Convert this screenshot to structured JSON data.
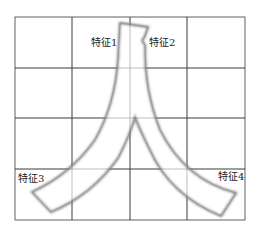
{
  "diagram": {
    "character": "人",
    "grid": {
      "cols": 4,
      "rows": 4,
      "line_color": "#3a3a3a",
      "stroke_outline_color": "#8a8a8a"
    },
    "labels": [
      {
        "id": "feature-1",
        "text": "特征1"
      },
      {
        "id": "feature-2",
        "text": "特征2"
      },
      {
        "id": "feature-3",
        "text": "特征3"
      },
      {
        "id": "feature-4",
        "text": "特征4"
      }
    ]
  }
}
